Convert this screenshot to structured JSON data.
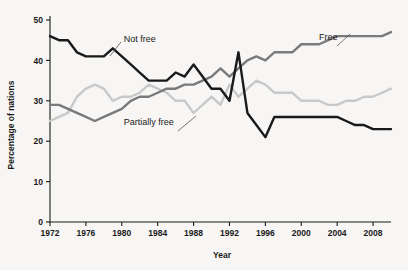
{
  "chart_data": {
    "type": "line",
    "title": "",
    "xlabel": "Year",
    "ylabel": "Percentage of nations",
    "xlim": [
      1972,
      2010
    ],
    "ylim": [
      0,
      50
    ],
    "grid": false,
    "legend_position": "inline-annotations",
    "xticks": [
      1972,
      1976,
      1980,
      1984,
      1988,
      1992,
      1996,
      2000,
      2004,
      2008
    ],
    "yticks": [
      0,
      10,
      20,
      30,
      40,
      50
    ],
    "x": [
      1972,
      1973,
      1974,
      1975,
      1976,
      1977,
      1978,
      1979,
      1980,
      1981,
      1982,
      1983,
      1984,
      1985,
      1986,
      1987,
      1988,
      1989,
      1990,
      1991,
      1992,
      1993,
      1994,
      1995,
      1996,
      1997,
      1998,
      1999,
      2000,
      2001,
      2002,
      2003,
      2004,
      2005,
      2006,
      2007,
      2008,
      2009,
      2010
    ],
    "series": [
      {
        "name": "Not free",
        "color": "#1a1a1a",
        "values": [
          46,
          45,
          45,
          42,
          41,
          41,
          41,
          43,
          41,
          39,
          37,
          35,
          35,
          35,
          37,
          36,
          39,
          36,
          33,
          33,
          30,
          42,
          27,
          24,
          21,
          26,
          26,
          26,
          26,
          26,
          26,
          26,
          26,
          25,
          24,
          24,
          23,
          23,
          23
        ]
      },
      {
        "name": "Free",
        "color": "#7a7a7a",
        "values": [
          29,
          29,
          28,
          27,
          26,
          25,
          26,
          27,
          28,
          30,
          31,
          31,
          32,
          33,
          33,
          34,
          34,
          35,
          36,
          38,
          36,
          38,
          40,
          41,
          40,
          42,
          42,
          42,
          44,
          44,
          44,
          45,
          46,
          46,
          46,
          46,
          46,
          46,
          47
        ]
      },
      {
        "name": "Partially free",
        "color": "#c9c9c9",
        "values": [
          25,
          26,
          27,
          31,
          33,
          34,
          33,
          30,
          31,
          31,
          32,
          34,
          33,
          32,
          30,
          30,
          27,
          29,
          31,
          29,
          34,
          31,
          33,
          35,
          34,
          32,
          32,
          32,
          30,
          30,
          30,
          29,
          29,
          30,
          30,
          31,
          31,
          32,
          33
        ]
      }
    ],
    "annotations": [
      {
        "text": "Not free",
        "x": 1982.0,
        "y": 44.5
      },
      {
        "text": "Free",
        "x": 2003.0,
        "y": 45.0
      },
      {
        "text": "Partially free",
        "x": 1983.0,
        "y": 24.0
      }
    ]
  }
}
